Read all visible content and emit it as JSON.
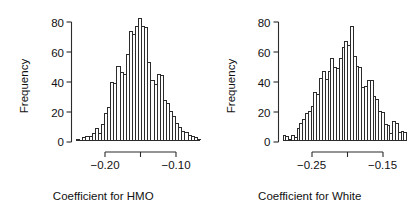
{
  "figure": {
    "background": "#ffffff",
    "axis_color": "#2b2b2b",
    "bar_fill": "#fdfdfd",
    "bar_stroke": "#2b2b2b",
    "panel_count": 2
  },
  "chart_data": [
    {
      "type": "bar",
      "title": "",
      "subtitle": "",
      "xlabel": "Coefficient for HMO",
      "ylabel": "Frequency",
      "grid": false,
      "legend": "none",
      "ylim": [
        0,
        92
      ],
      "y_ticks": [
        0,
        20,
        40,
        60,
        80
      ],
      "y_tick_labels": [
        "0",
        "20",
        "40",
        "60",
        "80"
      ],
      "xlim": [
        -0.235,
        -0.065
      ],
      "x_ticks": [
        -0.2,
        -0.15,
        -0.1
      ],
      "x_tick_labels": [
        "-0.20",
        "",
        "-0.10"
      ],
      "x_tick_labels_shown": [
        "−0.20",
        "−0.10"
      ],
      "bin_width": 0.004,
      "bin_centers": [
        -0.233,
        -0.229,
        -0.225,
        -0.221,
        -0.217,
        -0.213,
        -0.209,
        -0.205,
        -0.201,
        -0.197,
        -0.193,
        -0.189,
        -0.185,
        -0.181,
        -0.177,
        -0.173,
        -0.169,
        -0.165,
        -0.161,
        -0.157,
        -0.153,
        -0.149,
        -0.145,
        -0.141,
        -0.137,
        -0.133,
        -0.129,
        -0.125,
        -0.121,
        -0.117,
        -0.113,
        -0.109,
        -0.105,
        -0.101,
        -0.097,
        -0.093,
        -0.089,
        -0.085,
        -0.081,
        -0.077,
        -0.073,
        -0.069
      ],
      "categories": [
        "-0.233",
        "-0.229",
        "-0.225",
        "-0.221",
        "-0.217",
        "-0.213",
        "-0.209",
        "-0.205",
        "-0.201",
        "-0.197",
        "-0.193",
        "-0.189",
        "-0.185",
        "-0.181",
        "-0.177",
        "-0.173",
        "-0.169",
        "-0.165",
        "-0.161",
        "-0.157",
        "-0.153",
        "-0.149",
        "-0.145",
        "-0.141",
        "-0.137",
        "-0.133",
        "-0.129",
        "-0.125",
        "-0.121",
        "-0.117",
        "-0.113",
        "-0.109",
        "-0.105",
        "-0.101",
        "-0.097",
        "-0.093",
        "-0.089",
        "-0.085",
        "-0.081",
        "-0.077",
        "-0.073",
        "-0.069"
      ],
      "values": [
        1,
        0,
        0,
        0,
        2,
        3,
        3,
        5,
        9,
        5,
        12,
        20,
        25,
        44,
        43,
        56,
        51,
        50,
        65,
        82,
        80,
        86,
        92,
        86,
        85,
        59,
        45,
        42,
        50,
        49,
        30,
        28,
        22,
        18,
        13,
        10,
        7,
        6,
        4,
        3,
        2,
        1
      ]
    },
    {
      "type": "bar",
      "title": "",
      "subtitle": "",
      "xlabel": "Coefficient for White",
      "ylabel": "Frequency",
      "grid": false,
      "legend": "none",
      "ylim": [
        0,
        92
      ],
      "y_ticks": [
        0,
        20,
        40,
        60,
        80
      ],
      "y_tick_labels": [
        "0",
        "20",
        "40",
        "60",
        "80"
      ],
      "xlim": [
        -0.293,
        -0.117
      ],
      "x_ticks": [
        -0.25,
        -0.2,
        -0.15
      ],
      "x_tick_labels": [
        "-0.25",
        "",
        "-0.15"
      ],
      "x_tick_labels_shown": [
        "−0.25",
        "−0.15"
      ],
      "bin_width": 0.004,
      "bin_centers": [
        -0.291,
        -0.287,
        -0.283,
        -0.279,
        -0.275,
        -0.271,
        -0.267,
        -0.263,
        -0.259,
        -0.255,
        -0.251,
        -0.247,
        -0.243,
        -0.239,
        -0.235,
        -0.231,
        -0.227,
        -0.223,
        -0.219,
        -0.215,
        -0.211,
        -0.207,
        -0.203,
        -0.199,
        -0.195,
        -0.191,
        -0.187,
        -0.183,
        -0.179,
        -0.175,
        -0.171,
        -0.167,
        -0.163,
        -0.159,
        -0.155,
        -0.151,
        -0.147,
        -0.143,
        -0.139,
        -0.135,
        -0.131,
        -0.127,
        -0.123,
        -0.119
      ],
      "categories": [
        "-0.291",
        "-0.287",
        "-0.283",
        "-0.279",
        "-0.275",
        "-0.271",
        "-0.267",
        "-0.263",
        "-0.259",
        "-0.255",
        "-0.251",
        "-0.247",
        "-0.243",
        "-0.239",
        "-0.235",
        "-0.231",
        "-0.227",
        "-0.223",
        "-0.219",
        "-0.215",
        "-0.211",
        "-0.207",
        "-0.203",
        "-0.199",
        "-0.195",
        "-0.191",
        "-0.187",
        "-0.183",
        "-0.179",
        "-0.175",
        "-0.171",
        "-0.167",
        "-0.163",
        "-0.159",
        "-0.155",
        "-0.151",
        "-0.147",
        "-0.143",
        "-0.139",
        "-0.135",
        "-0.131",
        "-0.127",
        "-0.123",
        "-0.119"
      ],
      "values": [
        4,
        3,
        1,
        4,
        2,
        9,
        13,
        16,
        20,
        22,
        26,
        36,
        35,
        47,
        52,
        46,
        52,
        62,
        55,
        54,
        62,
        70,
        75,
        72,
        86,
        63,
        56,
        55,
        40,
        41,
        45,
        45,
        33,
        31,
        22,
        21,
        12,
        11,
        5,
        14,
        13,
        6,
        7,
        6
      ]
    }
  ]
}
